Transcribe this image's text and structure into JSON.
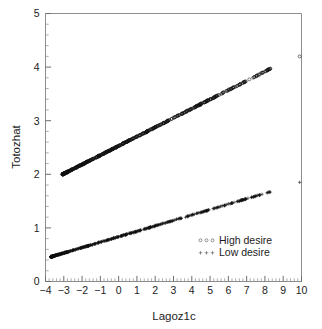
{
  "chart_data": {
    "type": "scatter",
    "title": "",
    "xlabel": "Lagoz1c",
    "ylabel": "Totozhat",
    "xlim": [
      -4,
      10
    ],
    "ylim": [
      0,
      5
    ],
    "xticks": [
      "-4",
      "-3",
      "-2",
      "-1",
      "0",
      "1",
      "2",
      "3",
      "4",
      "5",
      "6",
      "7",
      "8",
      "9",
      "10"
    ],
    "yticks": [
      "0",
      "1",
      "2",
      "3",
      "4",
      "5"
    ],
    "x_minor_per_major": 5,
    "y_minor_per_major": 5,
    "grid": false,
    "legend_position": "lower-right-inside",
    "series": [
      {
        "name": "High desire",
        "marker": "circle",
        "color": "#111111",
        "x_range": [
          -3.05,
          8.35
        ],
        "y_range": [
          2.0,
          3.98
        ],
        "intercept": 2.53,
        "slope": 0.1735,
        "outlier": {
          "x": 9.9,
          "y": 4.2
        },
        "n_points": 520
      },
      {
        "name": "Low desire",
        "marker": "plus",
        "color": "#111111",
        "x_range": [
          -3.7,
          8.3
        ],
        "y_range": [
          0.45,
          1.66
        ],
        "intercept": 0.835,
        "slope": 0.1012,
        "outlier": {
          "x": 9.9,
          "y": 1.85
        },
        "n_points": 520
      }
    ]
  },
  "legend": {
    "entries": [
      {
        "label": "High desire",
        "marker": "circle"
      },
      {
        "label": "Low desire",
        "marker": "plus"
      }
    ]
  },
  "axes": {
    "x_title": "Lagoz1c",
    "y_title": "Totozhat"
  },
  "colors": {
    "background": "#ffffff",
    "frame": "#8d8d8d",
    "marker": "#111111",
    "text": "#1c1c1c"
  }
}
